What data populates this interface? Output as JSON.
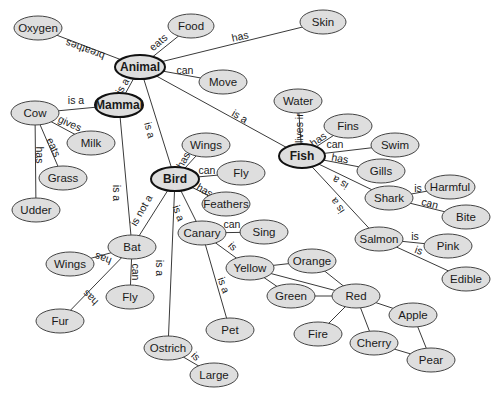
{
  "diagram": {
    "type": "concept-map",
    "colors": {
      "node_fill": "#dedede",
      "node_stroke": "#444444",
      "major_stroke": "#111111",
      "edge": "#3a3a3a",
      "background": "#ffffff"
    },
    "nodes": [
      {
        "id": "animal",
        "label": "Animal",
        "x": 140,
        "y": 67,
        "rx": 25,
        "ry": 12,
        "major": true
      },
      {
        "id": "mammal",
        "label": "Mammal",
        "x": 119,
        "y": 105,
        "rx": 24,
        "ry": 12,
        "major": true
      },
      {
        "id": "bird",
        "label": "Bird",
        "x": 175,
        "y": 179,
        "rx": 24,
        "ry": 12,
        "major": true
      },
      {
        "id": "fish",
        "label": "Fish",
        "x": 302,
        "y": 156,
        "rx": 23,
        "ry": 12,
        "major": true
      },
      {
        "id": "oxygen",
        "label": "Oxygen",
        "x": 38,
        "y": 28,
        "rx": 24,
        "ry": 12
      },
      {
        "id": "food",
        "label": "Food",
        "x": 191,
        "y": 26,
        "rx": 23,
        "ry": 12
      },
      {
        "id": "skin",
        "label": "Skin",
        "x": 323,
        "y": 22,
        "rx": 23,
        "ry": 12
      },
      {
        "id": "move",
        "label": "Move",
        "x": 223,
        "y": 82,
        "rx": 24,
        "ry": 12
      },
      {
        "id": "cow",
        "label": "Cow",
        "x": 35,
        "y": 113,
        "rx": 24,
        "ry": 12
      },
      {
        "id": "milk",
        "label": "Milk",
        "x": 91,
        "y": 143,
        "rx": 24,
        "ry": 12
      },
      {
        "id": "grass",
        "label": "Grass",
        "x": 63,
        "y": 178,
        "rx": 24,
        "ry": 12
      },
      {
        "id": "udder",
        "label": "Udder",
        "x": 36,
        "y": 210,
        "rx": 24,
        "ry": 12
      },
      {
        "id": "wings_b",
        "label": "Wings",
        "x": 206,
        "y": 145,
        "rx": 24,
        "ry": 12
      },
      {
        "id": "fly_b",
        "label": "Fly",
        "x": 241,
        "y": 173,
        "rx": 24,
        "ry": 12
      },
      {
        "id": "feathers",
        "label": "Feathers",
        "x": 226,
        "y": 204,
        "rx": 24,
        "ry": 12
      },
      {
        "id": "water",
        "label": "Water",
        "x": 298,
        "y": 101,
        "rx": 24,
        "ry": 12
      },
      {
        "id": "fins",
        "label": "Fins",
        "x": 348,
        "y": 126,
        "rx": 24,
        "ry": 12
      },
      {
        "id": "swim",
        "label": "Swim",
        "x": 395,
        "y": 145,
        "rx": 24,
        "ry": 12
      },
      {
        "id": "gills",
        "label": "Gills",
        "x": 381,
        "y": 171,
        "rx": 24,
        "ry": 12
      },
      {
        "id": "shark",
        "label": "Shark",
        "x": 389,
        "y": 198,
        "rx": 24,
        "ry": 12
      },
      {
        "id": "harmful",
        "label": "Harmful",
        "x": 450,
        "y": 187,
        "rx": 25,
        "ry": 12
      },
      {
        "id": "bite",
        "label": "Bite",
        "x": 466,
        "y": 217,
        "rx": 24,
        "ry": 12
      },
      {
        "id": "salmon",
        "label": "Salmon",
        "x": 379,
        "y": 239,
        "rx": 24,
        "ry": 12
      },
      {
        "id": "pink",
        "label": "Pink",
        "x": 448,
        "y": 246,
        "rx": 24,
        "ry": 12
      },
      {
        "id": "edible",
        "label": "Edible",
        "x": 466,
        "y": 279,
        "rx": 24,
        "ry": 12
      },
      {
        "id": "canary",
        "label": "Canary",
        "x": 202,
        "y": 233,
        "rx": 24,
        "ry": 12
      },
      {
        "id": "sing",
        "label": "Sing",
        "x": 264,
        "y": 232,
        "rx": 24,
        "ry": 12
      },
      {
        "id": "yellow",
        "label": "Yellow",
        "x": 250,
        "y": 268,
        "rx": 24,
        "ry": 12
      },
      {
        "id": "orange",
        "label": "Orange",
        "x": 312,
        "y": 261,
        "rx": 24,
        "ry": 12
      },
      {
        "id": "green",
        "label": "Green",
        "x": 291,
        "y": 296,
        "rx": 24,
        "ry": 12
      },
      {
        "id": "red",
        "label": "Red",
        "x": 356,
        "y": 296,
        "rx": 24,
        "ry": 12
      },
      {
        "id": "apple",
        "label": "Apple",
        "x": 413,
        "y": 315,
        "rx": 24,
        "ry": 12
      },
      {
        "id": "fire",
        "label": "Fire",
        "x": 318,
        "y": 334,
        "rx": 24,
        "ry": 12
      },
      {
        "id": "cherry",
        "label": "Cherry",
        "x": 374,
        "y": 343,
        "rx": 24,
        "ry": 12
      },
      {
        "id": "pear",
        "label": "Pear",
        "x": 431,
        "y": 360,
        "rx": 24,
        "ry": 12
      },
      {
        "id": "pet",
        "label": "Pet",
        "x": 230,
        "y": 330,
        "rx": 24,
        "ry": 12
      },
      {
        "id": "bat",
        "label": "Bat",
        "x": 132,
        "y": 247,
        "rx": 24,
        "ry": 12
      },
      {
        "id": "wings_bat",
        "label": "Wings",
        "x": 70,
        "y": 264,
        "rx": 24,
        "ry": 12
      },
      {
        "id": "fly_bat",
        "label": "Fly",
        "x": 130,
        "y": 297,
        "rx": 24,
        "ry": 12
      },
      {
        "id": "fur",
        "label": "Fur",
        "x": 60,
        "y": 321,
        "rx": 24,
        "ry": 12
      },
      {
        "id": "ostrich",
        "label": "Ostrich",
        "x": 168,
        "y": 348,
        "rx": 24,
        "ry": 12
      },
      {
        "id": "large",
        "label": "Large",
        "x": 214,
        "y": 375,
        "rx": 24,
        "ry": 12
      }
    ],
    "edges": [
      {
        "from": "animal",
        "to": "oxygen",
        "label": "breathes",
        "lx": 85,
        "ly": 50,
        "rot": 200
      },
      {
        "from": "animal",
        "to": "food",
        "label": "eats",
        "lx": 158,
        "ly": 42,
        "rot": -40
      },
      {
        "from": "animal",
        "to": "skin",
        "label": "has",
        "lx": 240,
        "ly": 36,
        "rot": -12
      },
      {
        "from": "animal",
        "to": "move",
        "label": "can",
        "lx": 185,
        "ly": 70,
        "rot": 0
      },
      {
        "from": "animal",
        "to": "mammal",
        "label": "is a",
        "lx": 122,
        "ly": 86,
        "rot": -60
      },
      {
        "from": "animal",
        "to": "bird",
        "label": "is a",
        "lx": 150,
        "ly": 130,
        "rot": 75
      },
      {
        "from": "animal",
        "to": "fish",
        "label": "is a",
        "lx": 240,
        "ly": 116,
        "rot": 30
      },
      {
        "from": "mammal",
        "to": "cow",
        "label": "is a",
        "lx": 76,
        "ly": 100,
        "rot": 0
      },
      {
        "from": "mammal",
        "to": "bat",
        "label": "is a",
        "lx": 117,
        "ly": 193,
        "rot": 90
      },
      {
        "from": "cow",
        "to": "milk",
        "label": "gives",
        "lx": 70,
        "ly": 123,
        "rot": 25
      },
      {
        "from": "cow",
        "to": "grass",
        "label": "eats",
        "lx": 54,
        "ly": 147,
        "rot": 65
      },
      {
        "from": "cow",
        "to": "udder",
        "label": "has",
        "lx": 40,
        "ly": 155,
        "rot": 90
      },
      {
        "from": "bird",
        "to": "wings_b",
        "label": "has",
        "lx": 183,
        "ly": 160,
        "rot": -60
      },
      {
        "from": "bird",
        "to": "fly_b",
        "label": "can",
        "lx": 207,
        "ly": 170,
        "rot": 0
      },
      {
        "from": "bird",
        "to": "feathers",
        "label": "has",
        "lx": 205,
        "ly": 190,
        "rot": 30
      },
      {
        "from": "bird",
        "to": "canary",
        "label": "is a",
        "lx": 179,
        "ly": 213,
        "rot": 70
      },
      {
        "from": "bird",
        "to": "ostrich",
        "label": "is a",
        "lx": 160,
        "ly": 268,
        "rot": 90
      },
      {
        "from": "bird",
        "to": "bat",
        "label": "is not a",
        "lx": 141,
        "ly": 210,
        "rot": -60
      },
      {
        "from": "fish",
        "to": "water",
        "label": "lives in",
        "lx": 299,
        "ly": 127,
        "rot": -90
      },
      {
        "from": "fish",
        "to": "fins",
        "label": "has",
        "lx": 318,
        "ly": 139,
        "rot": -35
      },
      {
        "from": "fish",
        "to": "swim",
        "label": "can",
        "lx": 335,
        "ly": 144,
        "rot": 0
      },
      {
        "from": "fish",
        "to": "gills",
        "label": "has",
        "lx": 340,
        "ly": 158,
        "rot": 10
      },
      {
        "from": "fish",
        "to": "shark",
        "label": "is a",
        "lx": 340,
        "ly": 183,
        "rot": 210
      },
      {
        "from": "fish",
        "to": "salmon",
        "label": "is a",
        "lx": 337,
        "ly": 206,
        "rot": 235
      },
      {
        "from": "shark",
        "to": "harmful",
        "label": "is",
        "lx": 418,
        "ly": 188,
        "rot": 0
      },
      {
        "from": "shark",
        "to": "bite",
        "label": "can",
        "lx": 430,
        "ly": 203,
        "rot": 15
      },
      {
        "from": "salmon",
        "to": "pink",
        "label": "is",
        "lx": 415,
        "ly": 236,
        "rot": 0
      },
      {
        "from": "salmon",
        "to": "edible",
        "label": "is",
        "lx": 419,
        "ly": 250,
        "rot": 20
      },
      {
        "from": "canary",
        "to": "sing",
        "label": "can",
        "lx": 232,
        "ly": 224,
        "rot": 0
      },
      {
        "from": "canary",
        "to": "yellow",
        "label": "is",
        "lx": 233,
        "ly": 246,
        "rot": 45
      },
      {
        "from": "canary",
        "to": "pet",
        "label": "is a",
        "lx": 224,
        "ly": 285,
        "rot": 70
      },
      {
        "from": "yellow",
        "to": "orange",
        "label": "",
        "lx": 0,
        "ly": 0,
        "rot": 0
      },
      {
        "from": "yellow",
        "to": "green",
        "label": "",
        "lx": 0,
        "ly": 0,
        "rot": 0
      },
      {
        "from": "yellow",
        "to": "red",
        "label": "",
        "lx": 0,
        "ly": 0,
        "rot": 0
      },
      {
        "from": "orange",
        "to": "red",
        "label": "",
        "lx": 0,
        "ly": 0,
        "rot": 0
      },
      {
        "from": "green",
        "to": "red",
        "label": "",
        "lx": 0,
        "ly": 0,
        "rot": 0
      },
      {
        "from": "red",
        "to": "apple",
        "label": "",
        "lx": 0,
        "ly": 0,
        "rot": 0
      },
      {
        "from": "red",
        "to": "fire",
        "label": "",
        "lx": 0,
        "ly": 0,
        "rot": 0
      },
      {
        "from": "red",
        "to": "cherry",
        "label": "",
        "lx": 0,
        "ly": 0,
        "rot": 0
      },
      {
        "from": "apple",
        "to": "pear",
        "label": "",
        "lx": 0,
        "ly": 0,
        "rot": 0
      },
      {
        "from": "cherry",
        "to": "pear",
        "label": "",
        "lx": 0,
        "ly": 0,
        "rot": 0
      },
      {
        "from": "bat",
        "to": "wings_bat",
        "label": "has",
        "lx": 103,
        "ly": 259,
        "rot": 200
      },
      {
        "from": "bat",
        "to": "fly_bat",
        "label": "can",
        "lx": 136,
        "ly": 272,
        "rot": 90
      },
      {
        "from": "bat",
        "to": "fur",
        "label": "has",
        "lx": 90,
        "ly": 298,
        "rot": 225
      },
      {
        "from": "ostrich",
        "to": "large",
        "label": "is",
        "lx": 196,
        "ly": 356,
        "rot": 45
      }
    ]
  }
}
